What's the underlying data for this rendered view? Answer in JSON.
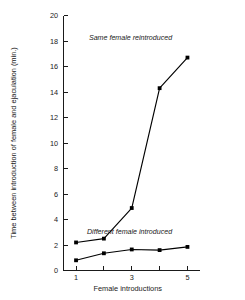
{
  "chart_data": {
    "type": "line",
    "title": "",
    "xlabel": "Female introductions",
    "ylabel": "Time between introduction of female and ejaculation (min.)",
    "x": [
      1,
      2,
      3,
      4,
      5
    ],
    "xlim": [
      0.55,
      5.45
    ],
    "ylim": [
      0,
      20
    ],
    "xticks": [
      1,
      2,
      3,
      4,
      5
    ],
    "xticklabels": [
      "1",
      "",
      "3",
      "",
      "5"
    ],
    "yticks": [
      0,
      2,
      4,
      6,
      8,
      10,
      12,
      14,
      16,
      18,
      20
    ],
    "yticklabels": [
      "0",
      "2",
      "4",
      "6",
      "8",
      "10",
      "12",
      "14",
      "16",
      "18",
      "20"
    ],
    "grid": false,
    "legend_position": "inline-annotations",
    "marker": "filled-square",
    "line_color": "#000000",
    "series": [
      {
        "name": "Same female reintroduced",
        "values": [
          2.2,
          2.5,
          4.9,
          14.3,
          16.7
        ],
        "annotation": "Same female reintroduced",
        "annotation_x": 4.45,
        "annotation_y": 18.1
      },
      {
        "name": "Different female introduced",
        "values": [
          0.8,
          1.35,
          1.65,
          1.6,
          1.85
        ],
        "annotation": "Different female introduced",
        "annotation_x": 4.45,
        "annotation_y": 2.85
      }
    ]
  },
  "annotations": {
    "upper": "Same female reintroduced",
    "lower": "Different female introduced"
  },
  "axes": {
    "x_title": "Female introductions",
    "y_title": "Time between introduction of female and ejaculation (min.)"
  }
}
